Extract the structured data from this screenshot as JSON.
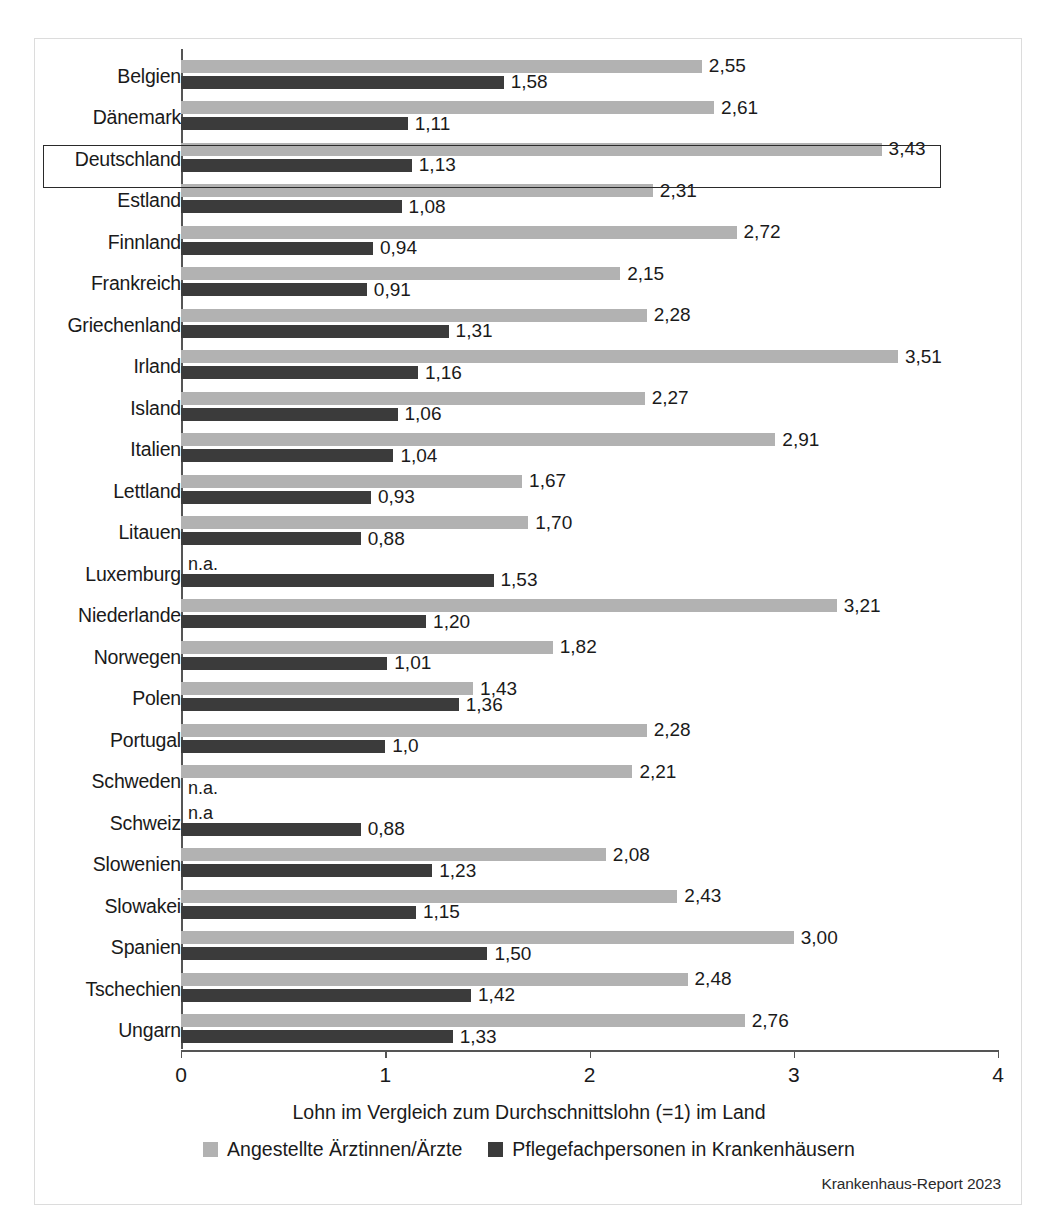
{
  "figure": {
    "source_note": "Krankenhaus-Report 2023",
    "highlight_country": "Deutschland",
    "colors": {
      "light": "#b2b2b2",
      "dark": "#3b3b3b",
      "axis": "#555555",
      "frame": "#dcdcdc"
    }
  },
  "legend": {
    "position": "bottom",
    "entries": [
      {
        "label": "Angestellte Ärztinnen/Ärzte",
        "color": "#b2b2b2",
        "swatch": "light-swatch"
      },
      {
        "label": "Pflegefachpersonen in Krankenhäusern",
        "color": "#3b3b3b",
        "swatch": "dark-swatch"
      }
    ]
  },
  "chart_data": {
    "type": "bar",
    "orientation": "horizontal",
    "title": "",
    "xlabel": "Lohn im Vergleich zum Durchschnittslohn (=1) im Land",
    "ylabel": "",
    "xlim": [
      0,
      4
    ],
    "xticks": [
      "0",
      "1",
      "2",
      "3",
      "4"
    ],
    "grid": false,
    "na_text": "n.a.",
    "categories": [
      "Belgien",
      "Dänemark",
      "Deutschland",
      "Estland",
      "Finnland",
      "Frankreich",
      "Griechenland",
      "Irland",
      "Island",
      "Italien",
      "Lettland",
      "Litauen",
      "Luxemburg",
      "Niederlande",
      "Norwegen",
      "Polen",
      "Portugal",
      "Schweden",
      "Schweiz",
      "Slowenien",
      "Slowakei",
      "Spanien",
      "Tschechien",
      "Ungarn"
    ],
    "series": [
      {
        "name": "Angestellte Ärztinnen/Ärzte",
        "color": "#b2b2b2",
        "values": [
          2.55,
          2.61,
          3.43,
          2.31,
          2.72,
          2.15,
          2.28,
          3.51,
          2.27,
          2.91,
          1.67,
          1.7,
          null,
          3.21,
          1.82,
          1.43,
          2.28,
          2.21,
          null,
          2.08,
          2.43,
          3.0,
          2.48,
          2.76
        ],
        "labels": [
          "2,55",
          "2,61",
          "3,43",
          "2,31",
          "2,72",
          "2,15",
          "2,28",
          "3,51",
          "2,27",
          "2,91",
          "1,67",
          "1,70",
          "n.a.",
          "3,21",
          "1,82",
          "1,43",
          "2,28",
          "2,21",
          "n.a",
          "2,08",
          "2,43",
          "3,00",
          "2,48",
          "2,76"
        ]
      },
      {
        "name": "Pflegefachpersonen in Krankenhäusern",
        "color": "#3b3b3b",
        "values": [
          1.58,
          1.11,
          1.13,
          1.08,
          0.94,
          0.91,
          1.31,
          1.16,
          1.06,
          1.04,
          0.93,
          0.88,
          1.53,
          1.2,
          1.01,
          1.36,
          1.0,
          null,
          0.88,
          1.23,
          1.15,
          1.5,
          1.42,
          1.33
        ],
        "labels": [
          "1,58",
          "1,11",
          "1,13",
          "1,08",
          "0,94",
          "0,91",
          "1,31",
          "1,16",
          "1,06",
          "1,04",
          "0,93",
          "0,88",
          "1,53",
          "1,20",
          "1,01",
          "1,36",
          "1,0",
          "n.a.",
          "0,88",
          "1,23",
          "1,15",
          "1,50",
          "1,42",
          "1,33"
        ]
      }
    ]
  }
}
